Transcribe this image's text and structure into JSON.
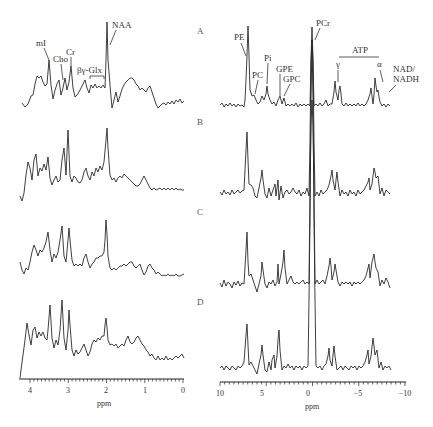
{
  "chart_data": [
    {
      "type": "line",
      "title": "1H MR spectra",
      "xlabel": "ppm",
      "ylabel": "",
      "xlim": [
        4.2,
        0
      ],
      "x_ticks": [
        "4",
        "3",
        "2",
        "1",
        "0"
      ],
      "grid": false,
      "series": [
        {
          "name": "A",
          "peaks": [
            {
              "label": "mI",
              "ppm": 3.56,
              "height": 0.55
            },
            {
              "label": "Cho",
              "ppm": 3.2,
              "height": 0.35
            },
            {
              "label": "Cr",
              "ppm": 3.02,
              "height": 0.52
            },
            {
              "label": "βγ-Glx",
              "ppm": 2.35,
              "height": 0.25
            },
            {
              "label": "NAA",
              "ppm": 2.01,
              "height": 1.0
            }
          ]
        },
        {
          "name": "B",
          "peaks": [
            {
              "label": "mI",
              "ppm": 3.56,
              "height": 0.55
            },
            {
              "label": "Cho",
              "ppm": 3.2,
              "height": 0.55
            },
            {
              "label": "Cr",
              "ppm": 3.02,
              "height": 0.85
            },
            {
              "label": "NAA",
              "ppm": 2.01,
              "height": 1.0
            }
          ]
        },
        {
          "name": "C",
          "peaks": [
            {
              "label": "mI",
              "ppm": 3.56,
              "height": 0.55
            },
            {
              "label": "Cho",
              "ppm": 3.2,
              "height": 0.75
            },
            {
              "label": "Cr",
              "ppm": 3.02,
              "height": 0.85
            },
            {
              "label": "NAA",
              "ppm": 2.01,
              "height": 0.7
            }
          ]
        },
        {
          "name": "D",
          "peaks": [
            {
              "label": "mI",
              "ppm": 3.56,
              "height": 0.75
            },
            {
              "label": "Cho",
              "ppm": 3.2,
              "height": 0.95
            },
            {
              "label": "Cr",
              "ppm": 3.02,
              "height": 0.8
            },
            {
              "label": "NAA",
              "ppm": 2.01,
              "height": 0.6
            }
          ]
        }
      ],
      "annotations": [
        "mI",
        "Cho",
        "Cr",
        "βγ-Glx",
        "NAA"
      ]
    },
    {
      "type": "line",
      "title": "31P MR spectra",
      "xlabel": "ppm",
      "ylabel": "",
      "xlim": [
        10,
        -10
      ],
      "x_ticks": [
        "10",
        "5",
        "0",
        "−5",
        "−10"
      ],
      "grid": false,
      "series": [
        {
          "name": "A",
          "peaks": [
            {
              "label": "PE",
              "ppm": 6.6,
              "height": 0.75
            },
            {
              "label": "PC",
              "ppm": 6.0,
              "height": 0.15
            },
            {
              "label": "Pi",
              "ppm": 4.9,
              "height": 0.3
            },
            {
              "label": "GPE",
              "ppm": 3.5,
              "height": 0.15
            },
            {
              "label": "GPC",
              "ppm": 2.9,
              "height": 0.2
            },
            {
              "label": "PCr",
              "ppm": 0.0,
              "height": 1.0
            },
            {
              "label": "γ-ATP",
              "ppm": -2.5,
              "height": 0.3
            },
            {
              "label": "α-ATP",
              "ppm": -7.6,
              "height": 0.3
            },
            {
              "label": "NAD/NADH",
              "ppm": -8.2,
              "height": 0.4
            }
          ]
        },
        {
          "name": "B",
          "peaks": [
            {
              "label": "PE",
              "ppm": 6.6,
              "height": 0.6
            },
            {
              "label": "Pi",
              "ppm": 4.9,
              "height": 0.25
            },
            {
              "label": "PCr",
              "ppm": 0.0,
              "height": 1.0
            },
            {
              "label": "γ-ATP",
              "ppm": -2.5,
              "height": 0.3
            },
            {
              "label": "α-ATP",
              "ppm": -7.6,
              "height": 0.3
            }
          ]
        },
        {
          "name": "C",
          "peaks": [
            {
              "label": "PE",
              "ppm": 6.6,
              "height": 0.6
            },
            {
              "label": "Pi",
              "ppm": 4.9,
              "height": 0.35
            },
            {
              "label": "GPC",
              "ppm": 2.9,
              "height": 0.45
            },
            {
              "label": "PCr",
              "ppm": 0.0,
              "height": 1.0
            },
            {
              "label": "γ-ATP",
              "ppm": -2.5,
              "height": 0.35
            },
            {
              "label": "α-ATP",
              "ppm": -7.6,
              "height": 0.45
            }
          ]
        },
        {
          "name": "D",
          "peaks": [
            {
              "label": "PE",
              "ppm": 6.6,
              "height": 0.45
            },
            {
              "label": "Pi",
              "ppm": 4.9,
              "height": 0.3
            },
            {
              "label": "GPC",
              "ppm": 2.9,
              "height": 0.5
            },
            {
              "label": "PCr",
              "ppm": 0.0,
              "height": 1.0
            },
            {
              "label": "γ-ATP",
              "ppm": -2.5,
              "height": 0.25
            },
            {
              "label": "α-ATP",
              "ppm": -7.6,
              "height": 0.4
            }
          ]
        }
      ],
      "annotations": [
        "PE",
        "PC",
        "Pi",
        "GPE",
        "GPC",
        "PCr",
        "ATP",
        "γ",
        "α",
        "NAD/",
        "NADH"
      ]
    }
  ],
  "panel_labels": [
    "A",
    "B",
    "C",
    "D"
  ],
  "left": {
    "labels": {
      "mi": "mI",
      "cho": "Cho",
      "cr": "Cr",
      "glx": "βγ-Glx",
      "naa": "NAA"
    },
    "axis": {
      "ticks": [
        "4",
        "3",
        "2",
        "1",
        "0"
      ],
      "label": "ppm"
    }
  },
  "right": {
    "labels": {
      "pe": "PE",
      "pc": "PC",
      "pi": "Pi",
      "gpe": "GPE",
      "gpc": "GPC",
      "pcr": "PCr",
      "atp": "ATP",
      "gamma": "γ",
      "alpha": "α",
      "nad1": "NAD/",
      "nad2": "NADH"
    },
    "axis": {
      "ticks": [
        "10",
        "5",
        "0",
        "−5",
        "−10"
      ],
      "label": "ppm"
    }
  }
}
